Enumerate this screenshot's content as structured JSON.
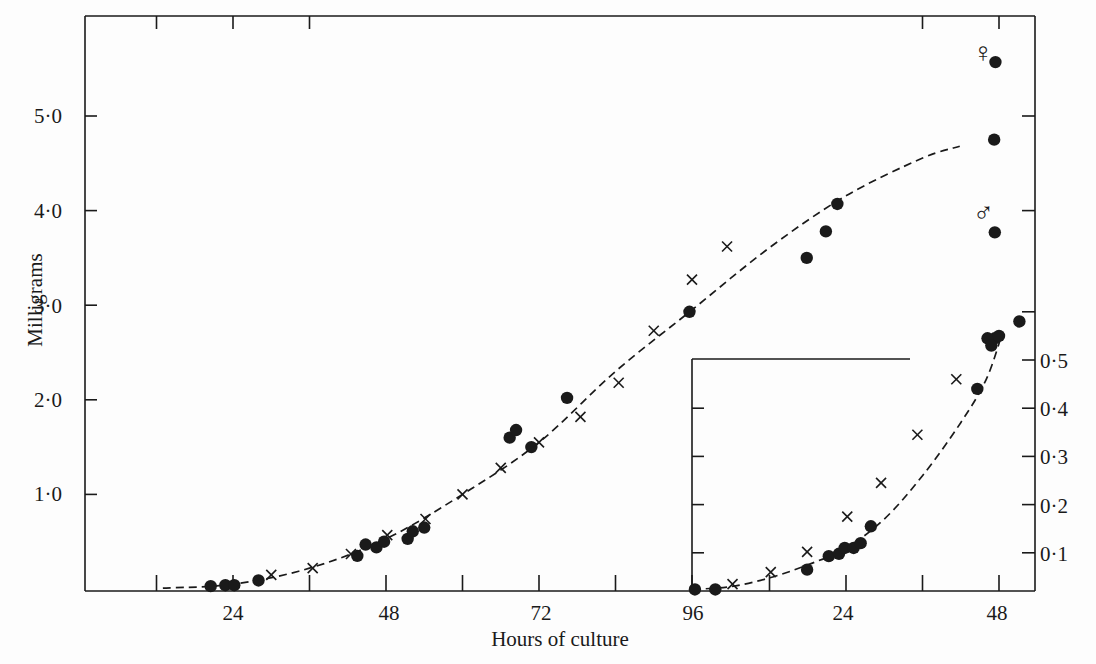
{
  "chart_data": {
    "type": "scatter",
    "title": "",
    "xlabel": "Hours of culture",
    "ylabel": "Milligrams",
    "grid": false,
    "legend": "none (symbols: ● and × series; ♀ and ♂ annotations)",
    "main": {
      "xlim": [
        0,
        150
      ],
      "ylim": [
        0,
        5.9
      ],
      "x_ticks": [
        12,
        24,
        36,
        48,
        60,
        72,
        84,
        96
      ],
      "x_tick_labels": [
        "",
        "24",
        "",
        "48",
        "",
        "72",
        "",
        "96"
      ],
      "y_ticks": [
        1.0,
        2.0,
        3.0,
        4.0,
        5.0
      ],
      "y_tick_labels": [
        "1·0",
        "2·0",
        "3·0",
        "4·0",
        "5·0"
      ],
      "series": [
        {
          "name": "dots",
          "marker": "filled-circle",
          "points": [
            [
              20.5,
              0.03
            ],
            [
              22.8,
              0.04
            ],
            [
              24.2,
              0.04
            ],
            [
              28.0,
              0.09
            ],
            [
              43.5,
              0.35
            ],
            [
              44.8,
              0.47
            ],
            [
              46.5,
              0.44
            ],
            [
              47.7,
              0.5
            ],
            [
              51.4,
              0.53
            ],
            [
              52.2,
              0.61
            ],
            [
              54.0,
              0.65
            ],
            [
              67.4,
              1.6
            ],
            [
              68.4,
              1.68
            ],
            [
              70.8,
              1.5
            ],
            [
              76.4,
              2.02
            ],
            [
              95.6,
              2.93
            ],
            [
              114.0,
              3.5
            ],
            [
              117.0,
              3.78
            ],
            [
              118.8,
              4.07
            ],
            [
              143.6,
              5.57
            ],
            [
              143.4,
              4.75
            ],
            [
              143.5,
              3.77
            ],
            [
              143.5,
              2.65
            ]
          ]
        },
        {
          "name": "crosses",
          "marker": "x",
          "points": [
            [
              30.0,
              0.15
            ],
            [
              36.5,
              0.22
            ],
            [
              42.5,
              0.37
            ],
            [
              48.2,
              0.57
            ],
            [
              54.2,
              0.74
            ],
            [
              60.0,
              1.0
            ],
            [
              66.0,
              1.28
            ],
            [
              72.0,
              1.55
            ],
            [
              78.5,
              1.82
            ],
            [
              84.5,
              2.18
            ],
            [
              90.0,
              2.73
            ],
            [
              96.0,
              3.27
            ],
            [
              101.5,
              3.62
            ]
          ]
        },
        {
          "name": "fitted-curve",
          "style": "dashed",
          "points": [
            [
              13,
              0.01
            ],
            [
              24,
              0.05
            ],
            [
              36,
              0.22
            ],
            [
              48,
              0.53
            ],
            [
              60,
              1.0
            ],
            [
              72,
              1.55
            ],
            [
              84,
              2.3
            ],
            [
              96,
              2.95
            ],
            [
              108,
              3.6
            ],
            [
              120,
              4.15
            ],
            [
              132,
              4.55
            ],
            [
              138,
              4.68
            ]
          ]
        }
      ],
      "annotations": [
        {
          "symbol": "♀",
          "label": "female",
          "x": 141.7,
          "y": 5.68
        },
        {
          "symbol": "♂",
          "label": "male",
          "x": 141.7,
          "y": 3.98
        }
      ]
    },
    "inset": {
      "xlabel": "Hours (second culture)",
      "xlim": [
        0,
        54
      ],
      "ylim": [
        0,
        0.6
      ],
      "x_ticks": [
        12,
        24,
        36,
        48
      ],
      "x_tick_labels": [
        "",
        "24",
        "",
        "48"
      ],
      "y_ticks": [
        0.1,
        0.2,
        0.3,
        0.4,
        0.5,
        0.6
      ],
      "y_tick_labels": [
        "0·1",
        "0·2",
        "0·3",
        "0·4",
        "0·5",
        ""
      ],
      "series": [
        {
          "name": "inset-dots",
          "marker": "filled-circle",
          "points": [
            [
              0.3,
              0.024
            ],
            [
              3.5,
              0.024
            ],
            [
              17.9,
              0.065
            ],
            [
              21.3,
              0.093
            ],
            [
              22.9,
              0.098
            ],
            [
              23.8,
              0.11
            ],
            [
              25.2,
              0.11
            ],
            [
              26.3,
              0.12
            ],
            [
              27.9,
              0.155
            ],
            [
              44.6,
              0.44
            ],
            [
              46.2,
              0.545
            ],
            [
              46.8,
              0.53
            ],
            [
              48.0,
              0.55
            ],
            [
              51.2,
              0.58
            ]
          ]
        },
        {
          "name": "inset-crosses",
          "marker": "x",
          "points": [
            [
              6.2,
              0.035
            ],
            [
              12.2,
              0.06
            ],
            [
              17.9,
              0.102
            ],
            [
              24.2,
              0.175
            ],
            [
              29.5,
              0.245
            ],
            [
              35.2,
              0.345
            ],
            [
              41.3,
              0.46
            ]
          ]
        },
        {
          "name": "inset-curve",
          "style": "dashed",
          "points": [
            [
              0,
              0.024
            ],
            [
              6,
              0.03
            ],
            [
              12,
              0.048
            ],
            [
              18,
              0.075
            ],
            [
              24,
              0.11
            ],
            [
              30,
              0.17
            ],
            [
              36,
              0.26
            ],
            [
              42,
              0.37
            ],
            [
              46,
              0.46
            ],
            [
              48.5,
              0.555
            ]
          ]
        }
      ]
    }
  },
  "labels": {
    "xlabel": "Hours of culture",
    "ylabel": "Milligrams",
    "x_ticks_main": [
      "24",
      "48",
      "72",
      "96"
    ],
    "x_ticks_inset": [
      "24",
      "48"
    ],
    "y_ticks_main": [
      "1·0",
      "2·0",
      "3·0",
      "4·0",
      "5·0"
    ],
    "y_ticks_inset": [
      "0·1",
      "0·2",
      "0·3",
      "0·4",
      "0·5"
    ],
    "female_symbol": "♀",
    "male_symbol": "♂"
  }
}
